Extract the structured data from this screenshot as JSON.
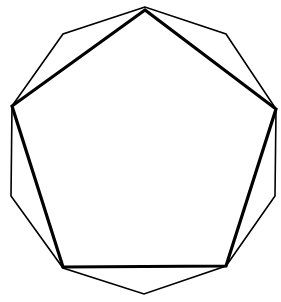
{
  "diagram": {
    "background": "#ffffff",
    "stroke_color": "#000000",
    "decagon": {
      "stroke_width": 1.6,
      "points": [
        [
          145,
          7
        ],
        [
          63,
          34
        ],
        [
          12,
          106
        ],
        [
          11,
          196
        ],
        [
          63,
          268
        ],
        [
          144,
          294
        ],
        [
          226,
          266
        ],
        [
          275,
          196
        ],
        [
          276,
          109
        ],
        [
          226,
          34
        ]
      ]
    },
    "pentagon": {
      "stroke_width": 3.2,
      "points": [
        [
          145,
          10
        ],
        [
          12,
          106
        ],
        [
          63,
          267
        ],
        [
          226,
          266
        ],
        [
          276,
          109
        ]
      ]
    }
  }
}
